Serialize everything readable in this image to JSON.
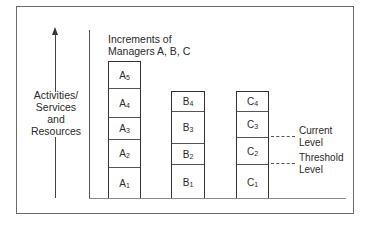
{
  "diagram": {
    "title_line1": "Increments of",
    "title_line2": "Managers A, B, C",
    "y_axis_label": [
      "Activities/",
      "Services",
      "and",
      "Resources"
    ],
    "columns": [
      {
        "manager": "A",
        "increments": [
          {
            "letter": "A",
            "index": "1"
          },
          {
            "letter": "A",
            "index": "2"
          },
          {
            "letter": "A",
            "index": "3"
          },
          {
            "letter": "A",
            "index": "4"
          },
          {
            "letter": "A",
            "index": "5"
          }
        ]
      },
      {
        "manager": "B",
        "increments": [
          {
            "letter": "B",
            "index": "1"
          },
          {
            "letter": "B",
            "index": "2"
          },
          {
            "letter": "B",
            "index": "3"
          },
          {
            "letter": "B",
            "index": "4"
          }
        ]
      },
      {
        "manager": "C",
        "increments": [
          {
            "letter": "C",
            "index": "1"
          },
          {
            "letter": "C",
            "index": "2"
          },
          {
            "letter": "C",
            "index": "3"
          },
          {
            "letter": "C",
            "index": "4"
          }
        ]
      }
    ],
    "levels": {
      "current": [
        "Current",
        "Level"
      ],
      "threshold": [
        "Threshold",
        "Level"
      ]
    }
  }
}
